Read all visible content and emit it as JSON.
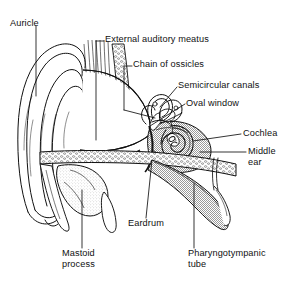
{
  "figure": {
    "background_color": "#ffffff",
    "ink_color": "#111111",
    "shade_color": "#b4b4b4",
    "width": 294,
    "height": 286
  },
  "labels": [
    {
      "id": "auricle",
      "text": "Auricle",
      "line1": "Auricle",
      "line2": "",
      "x": 10,
      "y": 18
    },
    {
      "id": "external-auditory-meatus",
      "text": "External auditory meatus",
      "line1": "External auditory meatus",
      "line2": "",
      "x": 105,
      "y": 38
    },
    {
      "id": "chain-of-ossicles",
      "text": "Chain of ossicles",
      "line1": "Chain of ossicles",
      "line2": "",
      "x": 133,
      "y": 63
    },
    {
      "id": "semicircular-canals",
      "text": "Semicircular canals",
      "line1": "Semicircular canals",
      "line2": "",
      "x": 178,
      "y": 84
    },
    {
      "id": "oval-window",
      "text": "Oval window",
      "line1": "Oval window",
      "line2": "",
      "x": 186,
      "y": 101
    },
    {
      "id": "cochlea",
      "text": "Cochlea",
      "line1": "Cochlea",
      "line2": "",
      "x": 243,
      "y": 131
    },
    {
      "id": "middle-ear",
      "text": "Middle ear",
      "line1": "Middle",
      "line2": "ear",
      "x": 248,
      "y": 152
    },
    {
      "id": "eardrum",
      "text": "Eardrum",
      "line1": "Eardrum",
      "line2": "",
      "x": 128,
      "y": 222
    },
    {
      "id": "mastoid-process",
      "text": "Mastoid process",
      "line1": "Mastoid",
      "line2": "process",
      "x": 62,
      "y": 252
    },
    {
      "id": "pharyngotympanic-tube",
      "text": "Pharyngotympanic tube",
      "line1": "Pharyngotympanic",
      "line2": "tube",
      "x": 188,
      "y": 252
    }
  ],
  "structures": [
    {
      "id": "auricle-pinna",
      "name": "Auricle (pinna)"
    },
    {
      "id": "ear-canal",
      "name": "External auditory meatus"
    },
    {
      "id": "tympanic-membrane",
      "name": "Eardrum (tympanic membrane)"
    },
    {
      "id": "ossicles",
      "name": "Chain of ossicles"
    },
    {
      "id": "semicircular-canals",
      "name": "Semicircular canals"
    },
    {
      "id": "oval-window",
      "name": "Oval window"
    },
    {
      "id": "cochlea-spiral",
      "name": "Cochlea"
    },
    {
      "id": "tympanic-cavity",
      "name": "Middle ear cavity"
    },
    {
      "id": "auditory-tube",
      "name": "Pharyngotympanic (auditory) tube"
    },
    {
      "id": "mastoid-process",
      "name": "Mastoid process"
    },
    {
      "id": "temporal-bone",
      "name": "Temporal bone"
    }
  ]
}
